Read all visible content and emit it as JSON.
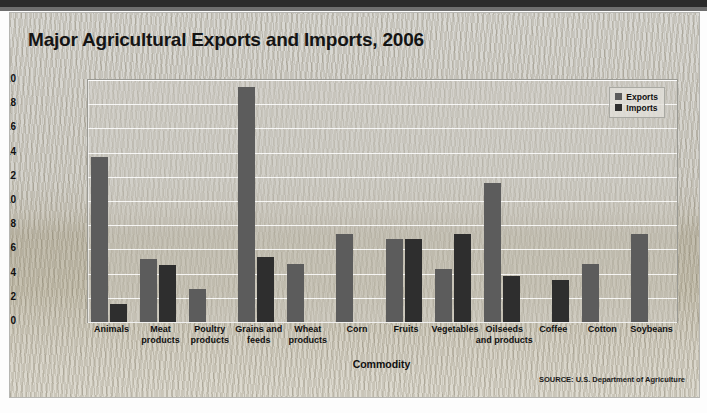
{
  "figure": {
    "title": "Major Agricultural Exports and Imports, 2006",
    "source": "SOURCE: U.S. Department of Agriculture"
  },
  "legend": {
    "position": "top-right",
    "entries": [
      {
        "label": "Exports",
        "color": "#5c5c5c"
      },
      {
        "label": "Imports",
        "color": "#2e2e2e"
      }
    ]
  },
  "chart_data": {
    "type": "bar",
    "title": "Major Agricultural Exports and Imports, 2006",
    "xlabel": "Commodity",
    "ylabel": "Dollars (in billions)",
    "ylim": [
      0,
      20
    ],
    "yticks": [
      0,
      2,
      4,
      6,
      8,
      10,
      12,
      14,
      16,
      18,
      20
    ],
    "grid": true,
    "legend_position": "top-right",
    "categories": [
      "Animals",
      "Meat products",
      "Poultry products",
      "Grains and feeds",
      "Wheat products",
      "Corn",
      "Fruits",
      "Vegetables",
      "Oilseeds and products",
      "Coffee",
      "Cotton",
      "Soybeans"
    ],
    "category_lines": [
      [
        "Animals"
      ],
      [
        "Meat",
        "products"
      ],
      [
        "Poultry",
        "products"
      ],
      [
        "Grains and",
        "feeds"
      ],
      [
        "Wheat",
        "products"
      ],
      [
        "Corn"
      ],
      [
        "Fruits"
      ],
      [
        "Vegetables"
      ],
      [
        "Oilseeds",
        "and products"
      ],
      [
        "Coffee"
      ],
      [
        "Cotton"
      ],
      [
        "Soybeans"
      ]
    ],
    "series": [
      {
        "name": "Exports",
        "color": "#5c5c5c",
        "values": [
          13.6,
          5.2,
          2.7,
          19.4,
          4.8,
          7.3,
          6.9,
          4.4,
          11.5,
          0,
          4.8,
          7.3
        ]
      },
      {
        "name": "Imports",
        "color": "#2e2e2e",
        "values": [
          1.5,
          4.7,
          0,
          5.4,
          0,
          0,
          6.9,
          7.3,
          3.8,
          3.5,
          0,
          0
        ]
      }
    ]
  }
}
